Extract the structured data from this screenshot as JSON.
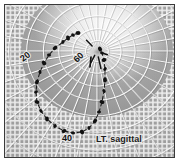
{
  "figure": {
    "name": "visual-field-perimetry-chart",
    "caption": "LT. sagittal",
    "background_color": "#b8b8b8",
    "frame_color": "#3a3a3a",
    "grid_color": "#ffffff",
    "grid_shadow_color": "#4a4a4a",
    "contour_color": "#111111",
    "inner_field_color": "#e8e8e8"
  },
  "labels": {
    "left_meridian": "20",
    "right_meridian": "60",
    "bottom_meridian": "40",
    "caption": "LT. sagittal"
  },
  "chart_data": {
    "type": "scatter",
    "title": "LT. sagittal",
    "xlabel": "",
    "ylabel": "",
    "projection": "polar-warped",
    "grid": true,
    "legend": null,
    "annotations": [
      "20",
      "60",
      "40",
      "LT. sagittal"
    ],
    "pole": {
      "x": 92,
      "y": 46
    },
    "isopter_values": [
      20,
      40,
      60
    ],
    "series": [
      {
        "name": "isopter-contour",
        "style": "dotted-heavy",
        "points": [
          [
            73,
            28
          ],
          [
            68,
            30
          ],
          [
            63,
            33
          ],
          [
            58,
            37
          ],
          [
            50,
            43
          ],
          [
            44,
            50
          ],
          [
            39,
            58
          ],
          [
            35,
            67
          ],
          [
            32,
            77
          ],
          [
            31,
            87
          ],
          [
            32,
            97
          ],
          [
            36,
            106
          ],
          [
            42,
            114
          ],
          [
            50,
            121
          ],
          [
            59,
            126
          ],
          [
            68,
            128
          ],
          [
            77,
            127
          ],
          [
            84,
            123
          ],
          [
            90,
            116
          ],
          [
            94,
            107
          ],
          [
            97,
            97
          ],
          [
            99,
            86
          ],
          [
            100,
            75
          ],
          [
            100,
            64
          ],
          [
            99,
            55
          ],
          [
            97,
            48
          ],
          [
            95,
            44
          ]
        ]
      },
      {
        "name": "blind-spot-marker",
        "style": "short-stroke",
        "points": [
          [
            86,
            52
          ],
          [
            85,
            62
          ]
        ]
      }
    ],
    "radial_meridians": 36,
    "concentric_rings": 11,
    "ring_spacing_deg": 10,
    "xlim": [
      0,
      171
    ],
    "ylim": [
      0,
      154
    ]
  }
}
